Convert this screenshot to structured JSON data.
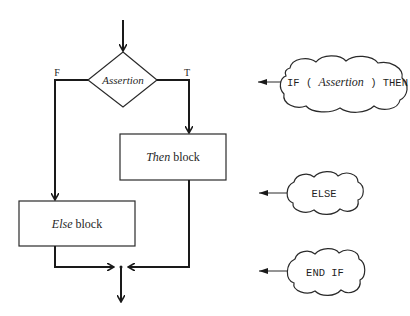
{
  "diagram": {
    "decision": {
      "label": "Assertion",
      "false_label": "F",
      "true_label": "T"
    },
    "then_block": {
      "label_italic": "Then",
      "label_rest": " block"
    },
    "else_block": {
      "label_italic": "Else",
      "label_rest": " block"
    },
    "annotations": [
      {
        "id": "if",
        "prefix": "IF ( ",
        "italic": "Assertion",
        "suffix": " ) THEN"
      },
      {
        "id": "else",
        "text": "ELSE"
      },
      {
        "id": "endif",
        "text": "END IF"
      }
    ],
    "colors": {
      "line": "#1a1a1a",
      "background": "#ffffff"
    }
  }
}
